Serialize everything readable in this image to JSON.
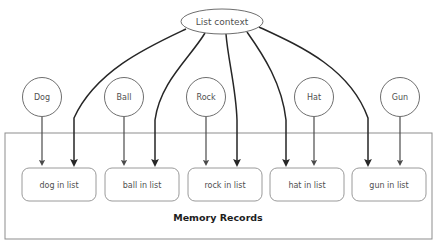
{
  "diagram": {
    "title_node": {
      "label": "List context",
      "shape": "ellipse",
      "cx": 222,
      "cy": 21.5,
      "rx": 41,
      "ry": 12.5
    },
    "container": {
      "label": "Memory Records",
      "x": 5,
      "y": 133,
      "width": 427,
      "height": 106,
      "label_x": 218,
      "label_y": 218
    },
    "source_nodes": [
      {
        "name": "dog-node",
        "label": "Dog",
        "cx": 42,
        "cy": 97,
        "r": 19.5
      },
      {
        "name": "ball-node",
        "label": "Ball",
        "cx": 124,
        "cy": 97,
        "r": 19.5
      },
      {
        "name": "rock-node",
        "label": "Rock",
        "cx": 206,
        "cy": 97,
        "r": 19.5
      },
      {
        "name": "hat-node",
        "label": "Hat",
        "cx": 314,
        "cy": 97,
        "r": 19.5
      },
      {
        "name": "gun-node",
        "label": "Gun",
        "cx": 400,
        "cy": 97,
        "r": 19.5
      }
    ],
    "record_boxes": [
      {
        "name": "record-dog",
        "label": "dog in list",
        "x": 22,
        "y": 168,
        "width": 74,
        "height": 33,
        "cx": 59,
        "cy": 184.5
      },
      {
        "name": "record-ball",
        "label": "ball in list",
        "x": 105,
        "y": 168,
        "width": 74,
        "height": 33,
        "cx": 142,
        "cy": 184.5
      },
      {
        "name": "record-rock",
        "label": "rock in list",
        "x": 188,
        "y": 168,
        "width": 74,
        "height": 33,
        "cx": 225,
        "cy": 184.5
      },
      {
        "name": "record-hat",
        "label": "hat in list",
        "x": 270,
        "y": 168,
        "width": 74,
        "height": 33,
        "cx": 307,
        "cy": 184.5
      },
      {
        "name": "record-gun",
        "label": "gun in list",
        "x": 352,
        "y": 168,
        "width": 74,
        "height": 33,
        "cx": 389,
        "cy": 184.5
      }
    ],
    "direct_edges": [
      {
        "name": "edge-dog-to-record",
        "from": "Dog",
        "to": "dog in list",
        "x": 42,
        "y1": 116.5,
        "y2": 163
      },
      {
        "name": "edge-ball-to-record",
        "from": "Ball",
        "to": "ball in list",
        "x": 124,
        "y1": 116.5,
        "y2": 163
      },
      {
        "name": "edge-rock-to-record",
        "from": "Rock",
        "to": "rock in list",
        "x": 206,
        "y1": 116.5,
        "y2": 163
      },
      {
        "name": "edge-hat-to-record",
        "from": "Hat",
        "to": "hat in list",
        "x": 314,
        "y1": 116.5,
        "y2": 163
      },
      {
        "name": "edge-gun-to-record",
        "from": "Gun",
        "to": "gun in list",
        "x": 400,
        "y1": 116.5,
        "y2": 163
      }
    ],
    "context_edges": [
      {
        "name": "edge-context-to-dog-record",
        "to": "dog in list",
        "path": "M 186,29 C 150,46 96,70 74,118 L 74,163"
      },
      {
        "name": "edge-context-to-ball-record",
        "to": "ball in list",
        "path": "M 205,33 C 190,58 160,82 155,120 L 155,163"
      },
      {
        "name": "edge-context-to-rock-record",
        "to": "rock in list",
        "path": "M 226,34 C 228,60 236,88 237,120 L 237,163"
      },
      {
        "name": "edge-context-to-hat-record",
        "to": "hat in list",
        "path": "M 247,32 C 264,56 282,84 286,120 L 286,163"
      },
      {
        "name": "edge-context-to-gun-record",
        "to": "gun in list",
        "path": "M 259,27 C 300,46 350,68 368,118 L 368,163"
      }
    ],
    "colors": {
      "background": "#ffffff",
      "node_stroke": "#6e6e6e",
      "box_stroke": "#9a9a9a",
      "container_stroke": "#8d8d8d",
      "edge": "#4a4a4a",
      "curve": "#262626",
      "text": "#4f4f4f",
      "container_text": "#1d1d1d"
    }
  }
}
